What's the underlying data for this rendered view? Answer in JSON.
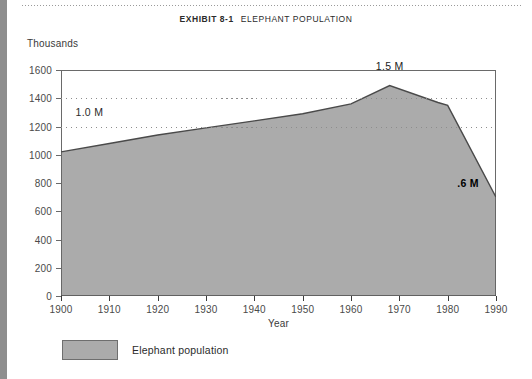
{
  "header": {
    "exhibit_number": "EXHIBIT 8-1",
    "exhibit_title": "ELEPHANT POPULATION"
  },
  "chart_data": {
    "type": "area",
    "title": "ELEPHANT POPULATION",
    "xlabel": "Year",
    "ylabel": "Thousands",
    "xlim": [
      1900,
      1990
    ],
    "ylim": [
      0,
      1600
    ],
    "grid": true,
    "gridlines": [
      1200,
      1400
    ],
    "legend_position": "bottom-left",
    "yticks": [
      0,
      200,
      400,
      600,
      800,
      1000,
      1200,
      1400,
      1600
    ],
    "xticks": [
      1900,
      1910,
      1920,
      1930,
      1940,
      1950,
      1960,
      1970,
      1980,
      1990
    ],
    "series": [
      {
        "name": "Elephant population",
        "color": "#ababab",
        "x": [
          1900,
          1910,
          1920,
          1930,
          1940,
          1950,
          1960,
          1968,
          1978,
          1980,
          1990
        ],
        "values": [
          1020,
          1080,
          1140,
          1190,
          1240,
          1290,
          1360,
          1490,
          1370,
          1350,
          700
        ]
      }
    ],
    "annotations": [
      {
        "text": "1.5 M",
        "x": 1968,
        "y": 1570
      },
      {
        "text": "1.0 M",
        "x": 1903,
        "y": 1300
      },
      {
        "text": ".6 M",
        "x": 1982,
        "y": 800
      }
    ]
  },
  "legend": {
    "items": [
      {
        "label": "Elephant population",
        "color": "#ababab"
      }
    ]
  }
}
